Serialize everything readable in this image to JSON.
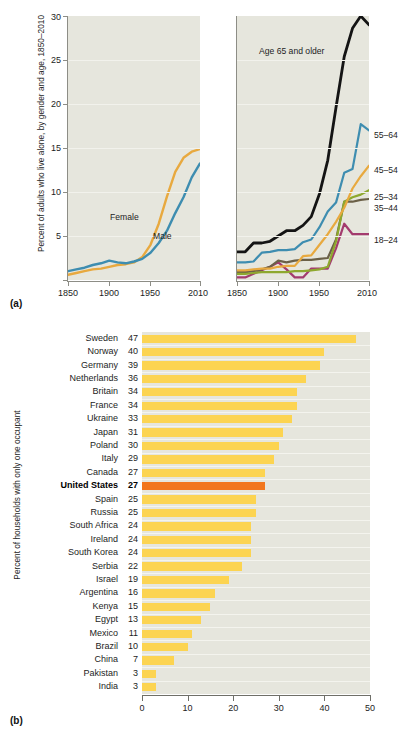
{
  "figure": {
    "panel_a_tag": "(a)",
    "panel_b_tag": "(b)"
  },
  "panel_a": {
    "ylabel": "Percent of adults who live alone, by gender and age, 1850–2010",
    "yticks": [
      "5",
      "10",
      "15",
      "20",
      "25",
      "30"
    ],
    "xticks": [
      "1850",
      "1900",
      "1950",
      "2010"
    ],
    "left_labels": {
      "female": "Female",
      "male": "Male"
    },
    "right_labels": {
      "age65": "Age 65 and older",
      "l5564": "55–64",
      "l4554": "45–54",
      "l2534": "25–34",
      "l3544": "35–44",
      "l1824": "18–24"
    }
  },
  "panel_b": {
    "ylabel": "Percent of households with only one occupant",
    "xticks": [
      "0",
      "10",
      "20",
      "30",
      "40",
      "50"
    ],
    "highlight_country": "United States"
  },
  "colors": {
    "plot_background": "#e6e6dd",
    "female": "#e8a93f",
    "male": "#3e8db0",
    "age65": "#141414",
    "c5564": "#3e8db0",
    "c4554": "#e8a93f",
    "c2534": "#8ea82e",
    "c3544": "#6b6047",
    "c1824": "#a33b6e",
    "bar": "#fcd451",
    "bar_highlight": "#f2761d",
    "axis": "#8d8d86"
  },
  "chart_data": [
    {
      "type": "line",
      "title": "Percent of adults who live alone, by gender",
      "xlabel": "",
      "ylabel": "Percent of adults who live alone, by gender and age, 1850–2010",
      "xlim": [
        1850,
        2010
      ],
      "ylim": [
        0,
        30
      ],
      "yticks": [
        5,
        10,
        15,
        20,
        25,
        30
      ],
      "xticks": [
        1850,
        1900,
        1950,
        2010
      ],
      "grid": true,
      "legend": "inline-labels",
      "x": [
        1850,
        1860,
        1870,
        1880,
        1890,
        1900,
        1910,
        1920,
        1930,
        1940,
        1950,
        1960,
        1970,
        1980,
        1990,
        2000,
        2010
      ],
      "series": [
        {
          "name": "Female",
          "color": "#e8a93f",
          "values": [
            0.6,
            0.8,
            1.0,
            1.2,
            1.3,
            1.5,
            1.7,
            1.8,
            2.0,
            2.6,
            4.0,
            6.4,
            9.5,
            12.3,
            14.0,
            14.8,
            15.1
          ]
        },
        {
          "name": "Male",
          "color": "#3e8db0",
          "values": [
            1.0,
            1.2,
            1.4,
            1.7,
            1.9,
            2.2,
            2.0,
            1.9,
            2.1,
            2.4,
            3.1,
            4.2,
            5.6,
            7.6,
            9.4,
            11.2,
            12.8
          ]
        }
      ]
    },
    {
      "type": "line",
      "title": "Percent of adults who live alone, by age",
      "xlabel": "",
      "ylabel": "Percent of adults who live alone, by gender and age, 1850–2010",
      "xlim": [
        1850,
        2010
      ],
      "ylim": [
        0,
        30
      ],
      "yticks": [
        5,
        10,
        15,
        20,
        25,
        30
      ],
      "xticks": [
        1850,
        1900,
        1950,
        2010
      ],
      "grid": true,
      "legend": "right",
      "x": [
        1850,
        1860,
        1870,
        1880,
        1890,
        1900,
        1910,
        1920,
        1930,
        1940,
        1950,
        1960,
        1970,
        1980,
        1990,
        2000,
        2010
      ],
      "series": [
        {
          "name": "Age 65 and older",
          "color": "#141414",
          "values": [
            3.2,
            3.2,
            4.2,
            4.2,
            4.4,
            5.0,
            5.6,
            5.6,
            6.2,
            7.2,
            9.8,
            13.6,
            19.6,
            25.4,
            28.6,
            30.0,
            29.0
          ]
        },
        {
          "name": "55–64",
          "color": "#3e8db0",
          "values": [
            2.0,
            2.0,
            2.1,
            3.1,
            3.2,
            3.4,
            3.4,
            3.5,
            4.3,
            4.6,
            6.0,
            7.8,
            8.8,
            12.2,
            12.6,
            14.8,
            17.0
          ]
        },
        {
          "name": "45–54",
          "color": "#e8a93f",
          "values": [
            1.1,
            1.1,
            1.2,
            1.3,
            1.3,
            1.5,
            1.6,
            1.6,
            2.7,
            2.8,
            4.0,
            5.2,
            6.6,
            8.2,
            10.4,
            11.8,
            13.0
          ]
        },
        {
          "name": "25–34",
          "color": "#8ea82e",
          "values": [
            0.7,
            0.7,
            0.8,
            0.9,
            0.9,
            0.9,
            0.9,
            1.0,
            1.0,
            1.1,
            1.2,
            1.5,
            4.4,
            8.9,
            9.4,
            9.7,
            10.2
          ]
        },
        {
          "name": "35–44",
          "color": "#6b6047",
          "values": [
            0.9,
            0.9,
            1.0,
            1.2,
            1.5,
            2.2,
            2.0,
            2.2,
            2.3,
            2.3,
            2.4,
            2.5,
            4.6,
            8.9,
            8.9,
            9.1,
            9.2
          ]
        },
        {
          "name": "18–24",
          "color": "#a33b6e",
          "values": [
            0.3,
            0.3,
            0.7,
            1.1,
            1.5,
            2.0,
            1.2,
            0.3,
            0.3,
            1.3,
            1.3,
            1.3,
            3.6,
            6.4,
            5.2,
            5.2,
            5.2
          ]
        }
      ]
    },
    {
      "type": "bar",
      "orientation": "horizontal",
      "title": "",
      "xlabel": "",
      "ylabel": "Percent of households with only one occupant",
      "xlim": [
        0,
        50
      ],
      "xticks": [
        0,
        10,
        20,
        30,
        40,
        50
      ],
      "grid": false,
      "highlight": "United States",
      "categories": [
        "Sweden",
        "Norway",
        "Germany",
        "Netherlands",
        "Britain",
        "France",
        "Ukraine",
        "Japan",
        "Poland",
        "Italy",
        "Canada",
        "United States",
        "Spain",
        "Russia",
        "South Africa",
        "Ireland",
        "South Korea",
        "Serbia",
        "Israel",
        "Argentina",
        "Kenya",
        "Egypt",
        "Mexico",
        "Brazil",
        "China",
        "Pakistan",
        "India"
      ],
      "values": [
        47,
        40,
        39,
        36,
        34,
        34,
        33,
        31,
        30,
        29,
        27,
        27,
        25,
        25,
        24,
        24,
        24,
        22,
        19,
        16,
        15,
        13,
        11,
        10,
        7,
        3,
        3
      ]
    }
  ]
}
